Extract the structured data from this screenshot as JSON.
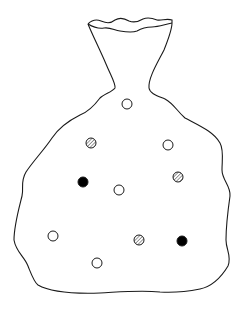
{
  "figure": {
    "colors": {
      "stroke": "#1a1a1a",
      "background": "#ffffff",
      "filled": "#000000",
      "hatch": "#333333"
    }
  },
  "particles": [
    {
      "type": "open",
      "cx": 127,
      "cy": 104,
      "r": 5
    },
    {
      "type": "hatched",
      "cx": 91,
      "cy": 143,
      "r": 5
    },
    {
      "type": "open",
      "cx": 168,
      "cy": 145,
      "r": 5
    },
    {
      "type": "filled",
      "cx": 83,
      "cy": 182,
      "r": 5
    },
    {
      "type": "open",
      "cx": 119,
      "cy": 190,
      "r": 5
    },
    {
      "type": "hatched",
      "cx": 178,
      "cy": 177,
      "r": 5
    },
    {
      "type": "open",
      "cx": 53,
      "cy": 236,
      "r": 5
    },
    {
      "type": "hatched",
      "cx": 139,
      "cy": 240,
      "r": 5
    },
    {
      "type": "filled",
      "cx": 182,
      "cy": 241,
      "r": 5
    },
    {
      "type": "open",
      "cx": 97,
      "cy": 263,
      "r": 5
    }
  ]
}
